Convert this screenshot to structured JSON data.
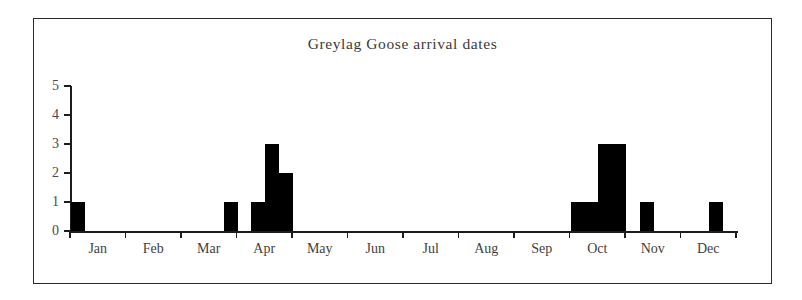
{
  "chart_data": {
    "type": "bar",
    "title": "Greylag Goose arrival dates",
    "xlabel": "",
    "ylabel": "",
    "ylim": [
      0,
      5
    ],
    "yticks": [
      0,
      1,
      2,
      3,
      4,
      5
    ],
    "grid": false,
    "legend": null,
    "categories": [
      "Jan",
      "Feb",
      "Mar",
      "Apr",
      "May",
      "Jun",
      "Jul",
      "Aug",
      "Sep",
      "Oct",
      "Nov",
      "Dec"
    ],
    "bin_note": "Quarter-month bins; each month spans 4 bins, 48 bins total across the year",
    "bins": [
      {
        "month": "Jan",
        "bin": 1,
        "value": 1
      },
      {
        "month": "Jan",
        "bin": 2,
        "value": 0
      },
      {
        "month": "Jan",
        "bin": 3,
        "value": 0
      },
      {
        "month": "Jan",
        "bin": 4,
        "value": 0
      },
      {
        "month": "Feb",
        "bin": 1,
        "value": 0
      },
      {
        "month": "Feb",
        "bin": 2,
        "value": 0
      },
      {
        "month": "Feb",
        "bin": 3,
        "value": 0
      },
      {
        "month": "Feb",
        "bin": 4,
        "value": 0
      },
      {
        "month": "Mar",
        "bin": 1,
        "value": 0
      },
      {
        "month": "Mar",
        "bin": 2,
        "value": 0
      },
      {
        "month": "Mar",
        "bin": 3,
        "value": 0
      },
      {
        "month": "Mar",
        "bin": 4,
        "value": 1
      },
      {
        "month": "Apr",
        "bin": 1,
        "value": 0
      },
      {
        "month": "Apr",
        "bin": 2,
        "value": 1
      },
      {
        "month": "Apr",
        "bin": 3,
        "value": 3
      },
      {
        "month": "Apr",
        "bin": 4,
        "value": 2
      },
      {
        "month": "May",
        "bin": 1,
        "value": 0
      },
      {
        "month": "May",
        "bin": 2,
        "value": 0
      },
      {
        "month": "May",
        "bin": 3,
        "value": 0
      },
      {
        "month": "May",
        "bin": 4,
        "value": 0
      },
      {
        "month": "Jun",
        "bin": 1,
        "value": 0
      },
      {
        "month": "Jun",
        "bin": 2,
        "value": 0
      },
      {
        "month": "Jun",
        "bin": 3,
        "value": 0
      },
      {
        "month": "Jun",
        "bin": 4,
        "value": 0
      },
      {
        "month": "Jul",
        "bin": 1,
        "value": 0
      },
      {
        "month": "Jul",
        "bin": 2,
        "value": 0
      },
      {
        "month": "Jul",
        "bin": 3,
        "value": 0
      },
      {
        "month": "Jul",
        "bin": 4,
        "value": 0
      },
      {
        "month": "Aug",
        "bin": 1,
        "value": 0
      },
      {
        "month": "Aug",
        "bin": 2,
        "value": 0
      },
      {
        "month": "Aug",
        "bin": 3,
        "value": 0
      },
      {
        "month": "Aug",
        "bin": 4,
        "value": 0
      },
      {
        "month": "Sep",
        "bin": 1,
        "value": 0
      },
      {
        "month": "Sep",
        "bin": 2,
        "value": 0
      },
      {
        "month": "Sep",
        "bin": 3,
        "value": 0
      },
      {
        "month": "Sep",
        "bin": 4,
        "value": 0
      },
      {
        "month": "Oct",
        "bin": 1,
        "value": 1
      },
      {
        "month": "Oct",
        "bin": 2,
        "value": 1
      },
      {
        "month": "Oct",
        "bin": 3,
        "value": 3
      },
      {
        "month": "Oct",
        "bin": 4,
        "value": 3
      },
      {
        "month": "Nov",
        "bin": 1,
        "value": 0
      },
      {
        "month": "Nov",
        "bin": 2,
        "value": 1
      },
      {
        "month": "Nov",
        "bin": 3,
        "value": 0
      },
      {
        "month": "Nov",
        "bin": 4,
        "value": 0
      },
      {
        "month": "Dec",
        "bin": 1,
        "value": 0
      },
      {
        "month": "Dec",
        "bin": 2,
        "value": 0
      },
      {
        "month": "Dec",
        "bin": 3,
        "value": 1
      },
      {
        "month": "Dec",
        "bin": 4,
        "value": 0
      }
    ],
    "monthly_totals": {
      "categories": [
        "Jan",
        "Feb",
        "Mar",
        "Apr",
        "May",
        "Jun",
        "Jul",
        "Aug",
        "Sep",
        "Oct",
        "Nov",
        "Dec"
      ],
      "values": [
        1,
        0,
        1,
        6,
        0,
        0,
        0,
        0,
        0,
        8,
        1,
        1
      ]
    },
    "colors": {
      "bar": "#000000",
      "axis": "#1c1c1c",
      "text": "#3f3f3f",
      "frame": "#2a2a2a",
      "background": "#ffffff"
    }
  }
}
